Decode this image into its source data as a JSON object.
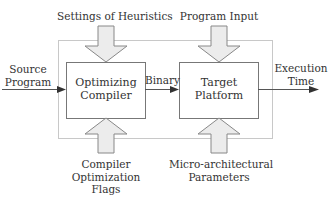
{
  "diagram": {
    "inputs_top": {
      "heuristics": "Settings of Heuristics",
      "program_input": "Program Input"
    },
    "inputs_bottom": {
      "compiler_flags": [
        "Compiler",
        "Optimization",
        "Flags"
      ],
      "micro_params": [
        "Micro-architectural",
        "Parameters"
      ]
    },
    "source": [
      "Source",
      "Program"
    ],
    "compiler_box": [
      "Optimizing",
      "Compiler"
    ],
    "binary_label": "Binary",
    "target_box": [
      "Target",
      "Platform"
    ],
    "output": [
      "Execution",
      "Time"
    ],
    "colors": {
      "stroke": "#555555",
      "frame": "#c8c8c8",
      "arrow_fill": "#e8e8e8",
      "text": "#333333"
    }
  }
}
